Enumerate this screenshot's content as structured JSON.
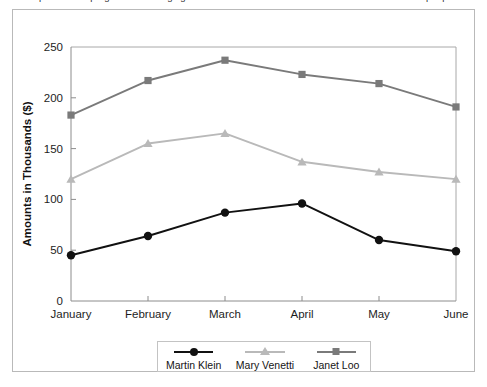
{
  "page": {
    "clipped_header_text": "a spreadsheet program for managing numbers and lists of data for a line chart for three salespeople"
  },
  "figure": {
    "legend_entries": [
      {
        "label": "Martin Klein",
        "marker": "circle",
        "color": "#111111"
      },
      {
        "label": "Mary Venetti",
        "marker": "triangle",
        "color": "#b9b9b9"
      },
      {
        "label": "Janet Loo",
        "marker": "square",
        "color": "#7a7a7a"
      }
    ]
  },
  "chart_data": {
    "type": "line",
    "title": "",
    "xlabel": "",
    "ylabel": "Amounts in Thousands ($)",
    "categories": [
      "January",
      "February",
      "March",
      "April",
      "May",
      "June"
    ],
    "ylim": [
      0,
      250
    ],
    "yticks": [
      0,
      50,
      100,
      150,
      200,
      250
    ],
    "ytick_labels": [
      "0",
      "50",
      "100",
      "150",
      "200",
      "250"
    ],
    "grid": false,
    "legend_position": "bottom",
    "series": [
      {
        "name": "Martin Klein",
        "marker": "circle",
        "color": "#111111",
        "values": [
          45,
          64,
          87,
          96,
          60,
          49
        ]
      },
      {
        "name": "Mary Venetti",
        "marker": "triangle",
        "color": "#b9b9b9",
        "values": [
          120,
          155,
          165,
          137,
          127,
          120
        ]
      },
      {
        "name": "Janet Loo",
        "marker": "square",
        "color": "#7a7a7a",
        "values": [
          183,
          217,
          237,
          223,
          214,
          191
        ]
      }
    ]
  }
}
